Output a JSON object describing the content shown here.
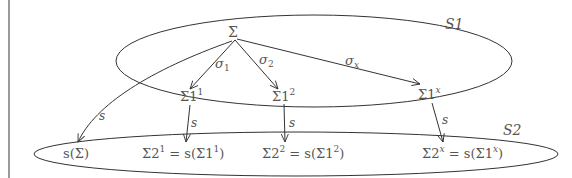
{
  "diagram": {
    "sets": [
      {
        "name": "S1",
        "label": "S1"
      },
      {
        "name": "S2",
        "label": "S2"
      }
    ],
    "nodes": {
      "sigma": "Σ",
      "sigma1_1": {
        "base": "Σ1",
        "sup": "1"
      },
      "sigma1_2": {
        "base": "Σ1",
        "sup": "2"
      },
      "sigma1_x": {
        "base": "Σ1",
        "sup": "x"
      },
      "s_sigma": {
        "pre": "s(Σ)"
      },
      "sigma2_1": {
        "base": "Σ2",
        "sup": "1",
        "eq": " = s(Σ1",
        "sup2": "1",
        "close": ")"
      },
      "sigma2_2": {
        "base": "Σ2",
        "sup": "2",
        "eq": " = s(Σ1",
        "sup2": "2",
        "close": ")"
      },
      "sigma2_x": {
        "base": "Σ2",
        "sup": "x",
        "eq": " = s(Σ1",
        "sup2": "x",
        "close": ")"
      }
    },
    "edges": [
      {
        "from": "Σ",
        "to": "Σ1^1",
        "label_base": "σ",
        "label_sub": "1"
      },
      {
        "from": "Σ",
        "to": "Σ1^2",
        "label_base": "σ",
        "label_sub": "2"
      },
      {
        "from": "Σ",
        "to": "Σ1^x",
        "label_base": "σ",
        "label_sub": "x"
      },
      {
        "from": "Σ",
        "to": "s(Σ)",
        "label": "s"
      },
      {
        "from": "Σ1^1",
        "to": "Σ2^1",
        "label": "s"
      },
      {
        "from": "Σ1^2",
        "to": "Σ2^2",
        "label": "s"
      },
      {
        "from": "Σ1^x",
        "to": "Σ2^x",
        "label": "s"
      }
    ],
    "colors": {
      "stroke": "#333333",
      "text": "#555555",
      "rule": "#9a9a9a"
    }
  }
}
